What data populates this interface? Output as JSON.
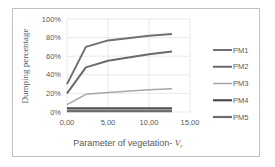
{
  "chart_data": {
    "type": "line",
    "title": "",
    "xlabel": "Parameter of vegetation- V",
    "xlabel_subscript": "r",
    "ylabel": "Dumping percentage",
    "xlim": [
      0,
      15
    ],
    "ylim": [
      0,
      100
    ],
    "x_ticks": [
      "0,00",
      "5,00",
      "10,00",
      "15,00"
    ],
    "y_ticks": [
      "0%",
      "20%",
      "40%",
      "60%",
      "80%",
      "100%"
    ],
    "grid": true,
    "legend_position": "right",
    "x": [
      0.0,
      2.3,
      5.0,
      10.0,
      12.8
    ],
    "series": [
      {
        "name": "PM1",
        "color": "#707070",
        "width": 2.0,
        "values": [
          30,
          70,
          77,
          82,
          84
        ]
      },
      {
        "name": "PM2",
        "color": "#6a6a6a",
        "width": 2.0,
        "values": [
          20,
          48,
          55,
          62,
          65
        ]
      },
      {
        "name": "PM3",
        "color": "#a6a6a6",
        "width": 1.5,
        "values": [
          8,
          19,
          21,
          24,
          25
        ]
      },
      {
        "name": "PM4",
        "color": "#4d4d4d",
        "width": 2.2,
        "values": [
          4,
          4,
          4,
          4,
          4
        ]
      },
      {
        "name": "PM5",
        "color": "#6e6e6e",
        "width": 2.2,
        "values": [
          1,
          1,
          1,
          1,
          1
        ]
      }
    ]
  },
  "legend": {
    "items": [
      "PM1",
      "PM2",
      "PM3",
      "PM4",
      "PM5"
    ]
  },
  "axes": {
    "x_title": "Parameter of vegetation- ",
    "x_title_var": "V",
    "x_title_sub": "r",
    "y_title": "Dumping percentage"
  }
}
